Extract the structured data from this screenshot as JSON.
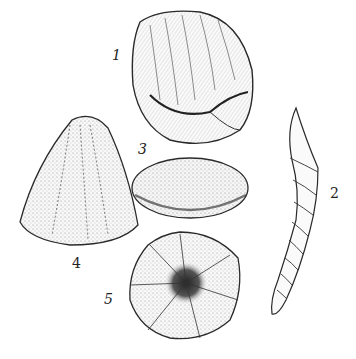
{
  "plate": {
    "background": "#ffffff",
    "ink": "#2a2a2a",
    "figures": [
      {
        "id": "1",
        "label": "1",
        "subject": "bivalve shell",
        "label_pos": [
          114,
          56
        ]
      },
      {
        "id": "2",
        "label": "2",
        "subject": "spiral turret shell",
        "label_pos": [
          332,
          194
        ]
      },
      {
        "id": "3",
        "label": "3",
        "subject": "oval sea urchin (top view)",
        "label_pos": [
          140,
          150
        ]
      },
      {
        "id": "4",
        "label": "4",
        "subject": "conical sea urchin (side view)",
        "label_pos": [
          72,
          258
        ]
      },
      {
        "id": "5",
        "label": "5",
        "subject": "sea urchin (underside view)",
        "label_pos": [
          106,
          300
        ]
      }
    ]
  }
}
